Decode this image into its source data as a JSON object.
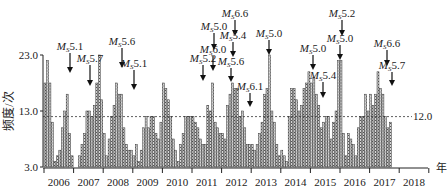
{
  "chart_data": {
    "type": "bar",
    "title": "",
    "xlabel": "年",
    "ylabel": "频度/次",
    "ylim": [
      3.0,
      23.0
    ],
    "yticks": [
      "3.0",
      "13.0",
      "23.0"
    ],
    "x_categories": [
      "2006",
      "2007",
      "2008",
      "2009",
      "2010",
      "2011",
      "2012",
      "2013",
      "2014",
      "2015",
      "2016",
      "2017",
      "2018"
    ],
    "reference_line": {
      "value": 12.0,
      "label": "12.0",
      "style": "dashed"
    },
    "series": [
      {
        "name": "monthly frequency",
        "granularity": "month",
        "start": "2006-01",
        "values": [
          18,
          22,
          18,
          11,
          4,
          5,
          6,
          10,
          13,
          16,
          9,
          5,
          3,
          3,
          5,
          7,
          9,
          13,
          13,
          12,
          14,
          18,
          23,
          15,
          9,
          5,
          8,
          12,
          14,
          18,
          16,
          16,
          10,
          7,
          6,
          6,
          5,
          7,
          4,
          6,
          10,
          12,
          10,
          12,
          12,
          9,
          8,
          11,
          18,
          17,
          15,
          12,
          8,
          6,
          4,
          7,
          9,
          12,
          12,
          12,
          12,
          11,
          10,
          8,
          7,
          7,
          14,
          13,
          18,
          11,
          10,
          9,
          9,
          8,
          14,
          16,
          18,
          17,
          17,
          12,
          13,
          10,
          7,
          7,
          7,
          6,
          7,
          9,
          11,
          16,
          17,
          23,
          13,
          11,
          7,
          5,
          6,
          5,
          4,
          12,
          17,
          17,
          15,
          13,
          14,
          17,
          18,
          20,
          18,
          19,
          16,
          14,
          10,
          11,
          12,
          12,
          8,
          11,
          13,
          22,
          22,
          9,
          5,
          9,
          8,
          7,
          5,
          10,
          12,
          12,
          16,
          13,
          16,
          14,
          16,
          20,
          17,
          16,
          12,
          10,
          11
        ]
      }
    ],
    "annotations": [
      {
        "label": "Ms5.1",
        "mag": "5.1",
        "x": 70,
        "ty": 50,
        "tip": 73
      },
      {
        "label": "Ms5.7",
        "mag": "5.7",
        "x": 90,
        "ty": 62,
        "tip": 86
      },
      {
        "label": "Ms5.6",
        "mag": "5.6",
        "x": 122,
        "ty": 45,
        "tip": 68
      },
      {
        "label": "Ms5.1",
        "mag": "5.1",
        "x": 134,
        "ty": 67,
        "tip": 90
      },
      {
        "label": "Ms5.2",
        "mag": "5.2",
        "x": 203,
        "ty": 62,
        "tip": 81
      },
      {
        "label": "Ms6.0",
        "mag": "6.0",
        "x": 213,
        "ty": 53,
        "tip": 71
      },
      {
        "label": "Ms5.0",
        "mag": "5.0",
        "x": 214,
        "ty": 30,
        "tip": 50
      },
      {
        "label": "Ms6.6",
        "mag": "6.6",
        "x": 235,
        "ty": 17,
        "tip": 36
      },
      {
        "label": "Ms5.4",
        "mag": "5.4",
        "x": 233,
        "ty": 39,
        "tip": 57
      },
      {
        "label": "Ms5.6",
        "mag": "5.6",
        "x": 231,
        "ty": 65,
        "tip": 82
      },
      {
        "label": "Ms6.1",
        "mag": "6.1",
        "x": 250,
        "ty": 90,
        "tip": 107
      },
      {
        "label": "Ms5.0",
        "mag": "5.0",
        "x": 269,
        "ty": 37,
        "tip": 55
      },
      {
        "label": "Ms5.0",
        "mag": "5.0",
        "x": 313,
        "ty": 52,
        "tip": 70
      },
      {
        "label": "Ms5.4",
        "mag": "5.4",
        "x": 323,
        "ty": 79,
        "tip": 98
      },
      {
        "label": "Ms5.2",
        "mag": "5.2",
        "x": 342,
        "ty": 17,
        "tip": 36
      },
      {
        "label": "Ms5.0",
        "mag": "5.0",
        "x": 340,
        "ty": 42,
        "tip": 60
      },
      {
        "label": "Ms6.6",
        "mag": "6.6",
        "x": 387,
        "ty": 47,
        "tip": 66
      },
      {
        "label": "Ms5.7",
        "mag": "5.7",
        "x": 392,
        "ty": 69,
        "tip": 86
      }
    ],
    "grid": false,
    "legend": null
  },
  "axis": {
    "y_top": "23.0",
    "y_mid": "13.0",
    "y_bottom": "3.0",
    "ylabel": "频度/次",
    "xlabel": "年",
    "ref_label": "12.0"
  }
}
